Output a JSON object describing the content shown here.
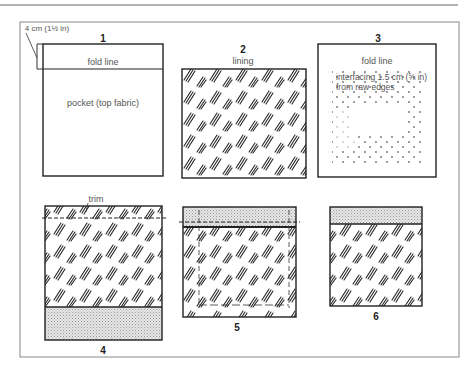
{
  "diagram": {
    "panels": [
      {
        "number": "1",
        "labels": {
          "measure": "4 cm (1½ in)",
          "fold": "fold line",
          "body": "pocket (top fabric)"
        }
      },
      {
        "number": "2",
        "labels": {
          "title": "lining"
        }
      },
      {
        "number": "3",
        "labels": {
          "fold": "fold line",
          "interfacing": "interfacing 1.5 cm (⅝ in) from raw edges"
        }
      },
      {
        "number": "4",
        "labels": {
          "trim": "trim"
        }
      },
      {
        "number": "5",
        "labels": {}
      },
      {
        "number": "6",
        "labels": {}
      }
    ],
    "colors": {
      "line": "#222222",
      "frame": "#777777",
      "shade": "#d4d4d4",
      "text": "#555555"
    }
  }
}
